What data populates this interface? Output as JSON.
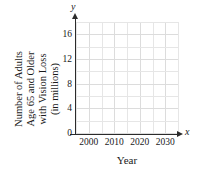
{
  "chart_data": {
    "type": "line",
    "title": "",
    "subtitle": "",
    "xlabel": "Year",
    "ylabel": "Number of Adults Age 65 and Older with Vision Loss (in millions)",
    "ylabel_lines": [
      "Number of Adults",
      "Age 65 and Older",
      "with Vision Loss",
      "(in millions)"
    ],
    "x_axis_letter": "x",
    "y_axis_letter": "y",
    "x_ticks": [
      "2000",
      "2010",
      "2020",
      "2030"
    ],
    "x_tick_values": [
      2000,
      2010,
      2020,
      2030
    ],
    "y_ticks": [
      "0",
      "4",
      "8",
      "12",
      "16"
    ],
    "y_tick_values": [
      0,
      4,
      8,
      12,
      16
    ],
    "xlim": [
      1995,
      2035
    ],
    "ylim": [
      0,
      18
    ],
    "grid": true,
    "grid_color": "#e6e6e6",
    "axis_color": "#2b2b2b",
    "legend": null,
    "legend_position": "none",
    "series": [],
    "values": [],
    "annotations": [],
    "note": "empty coordinate grid, no plotted data"
  },
  "figure": {
    "background": "#ffffff",
    "text_color": "#1a1a1a"
  }
}
